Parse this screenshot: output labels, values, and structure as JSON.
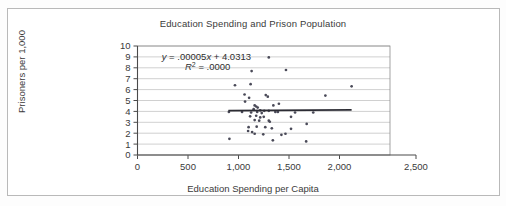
{
  "figure": {
    "title": "Education Spending and Prison Population",
    "x_axis_title": "Education Spending per Capita",
    "y_axis_title": "Prisoners per 1,000",
    "equation_label": "y = .00005x + 4.0313",
    "r_squared_label": "R2 = .0000",
    "r_squared_base": "R",
    "r_squared_exp": "2",
    "r_squared_rest": " = .0000",
    "point_color": "#4a4a58",
    "trend_color": "#2c2c34",
    "grid_color": "#b0b0b0",
    "axis_color": "#4a4a4a",
    "frame_color": "#b9b9b9",
    "background": "#ffffff"
  },
  "chart_data": {
    "type": "scatter",
    "title": "Education Spending and Prison Population",
    "xlabel": "Education Spending per Capita",
    "ylabel": "Prisoners per 1,000",
    "xlim": [
      0,
      2500
    ],
    "ylim": [
      0,
      10
    ],
    "xticks": [
      0,
      500,
      1000,
      1500,
      2000,
      2500
    ],
    "xtick_labels": [
      "0",
      "500",
      "1,000",
      "1,500",
      "2,000",
      "2,500"
    ],
    "yticks": [
      0,
      1,
      2,
      3,
      4,
      5,
      6,
      7,
      8,
      9,
      10
    ],
    "ytick_labels": [
      "0",
      "1",
      "2",
      "3",
      "4",
      "5",
      "6",
      "7",
      "8",
      "9",
      "10"
    ],
    "grid": "horizontal",
    "legend": "none",
    "annotations": [
      {
        "text": "y = .00005x + 4.0313",
        "x": 240,
        "y": 9.05,
        "italic_var": "y"
      },
      {
        "text": "R2 = .0000",
        "x": 470,
        "y": 8.1,
        "italic_var": "R"
      }
    ],
    "trendline": {
      "equation": "y = .00005x + 4.0313",
      "slope": 5e-05,
      "intercept": 4.0313,
      "r_squared": 0.0,
      "x_start": 900,
      "x_end": 2120
    },
    "series": [
      {
        "name": "States",
        "marker": "dot",
        "color": "#4a4a58",
        "points": [
          [
            1300,
            8.95
          ],
          [
            1130,
            7.7
          ],
          [
            1470,
            7.8
          ],
          [
            965,
            6.4
          ],
          [
            1120,
            6.5
          ],
          [
            2120,
            6.3
          ],
          [
            1060,
            5.55
          ],
          [
            1105,
            5.25
          ],
          [
            1270,
            5.5
          ],
          [
            1290,
            5.35
          ],
          [
            1860,
            5.45
          ],
          [
            1065,
            4.9
          ],
          [
            1160,
            4.55
          ],
          [
            1175,
            4.45
          ],
          [
            1190,
            4.35
          ],
          [
            1345,
            4.55
          ],
          [
            1400,
            4.7
          ],
          [
            1150,
            4.2
          ],
          [
            1215,
            4.1
          ],
          [
            1255,
            4.05
          ],
          [
            1300,
            4.05
          ],
          [
            905,
            3.95
          ],
          [
            1035,
            3.95
          ],
          [
            1125,
            3.9
          ],
          [
            1185,
            3.95
          ],
          [
            1230,
            3.85
          ],
          [
            1365,
            3.95
          ],
          [
            1390,
            3.95
          ],
          [
            1560,
            3.9
          ],
          [
            1740,
            3.9
          ],
          [
            1115,
            3.55
          ],
          [
            1175,
            3.6
          ],
          [
            1215,
            3.45
          ],
          [
            1250,
            3.5
          ],
          [
            1520,
            3.5
          ],
          [
            1160,
            3.2
          ],
          [
            1205,
            3.15
          ],
          [
            1300,
            3.15
          ],
          [
            1310,
            3.05
          ],
          [
            1675,
            2.85
          ],
          [
            1100,
            2.55
          ],
          [
            1180,
            2.6
          ],
          [
            1265,
            2.55
          ],
          [
            1330,
            2.45
          ],
          [
            1520,
            2.4
          ],
          [
            1095,
            2.2
          ],
          [
            1135,
            2.1
          ],
          [
            1160,
            1.95
          ],
          [
            1245,
            1.9
          ],
          [
            1425,
            1.85
          ],
          [
            1465,
            1.95
          ],
          [
            910,
            1.48
          ],
          [
            1340,
            1.35
          ],
          [
            1670,
            1.25
          ]
        ]
      }
    ]
  }
}
